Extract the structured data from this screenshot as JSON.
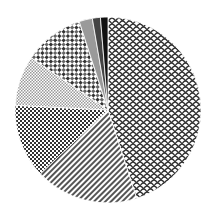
{
  "chart_data": {
    "type": "pie",
    "title": "",
    "categories": [
      "Slice A (scale pattern)",
      "Slice B (diagonal stripes)",
      "Slice C (dark checker)",
      "Slice D (light checker)",
      "Slice E (diagonal cross-hatch)",
      "Slice F (gray)",
      "Slice G (dark gray)",
      "Slice H (black)"
    ],
    "values": [
      45,
      18,
      12.8,
      8.7,
      10.5,
      2.3,
      1.4,
      1.3
    ],
    "start_angle_deg": 0,
    "direction": "clockwise",
    "legend": "none"
  }
}
